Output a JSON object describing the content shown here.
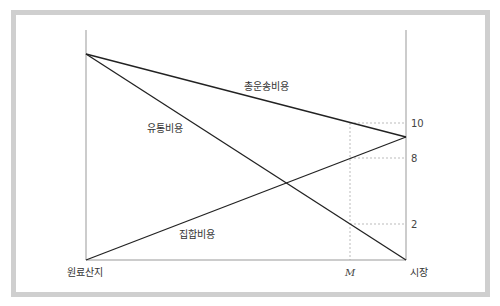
{
  "diagram": {
    "type": "transport-cost-diagram",
    "frame_color": "#cfcfcf",
    "line_color": "#222222",
    "axis_color": "#999999",
    "guide_color": "#aaaaaa",
    "labels": {
      "total_cost": "총운송비용",
      "distribution_cost": "유통비용",
      "collection_cost": "집합비용",
      "origin": "원료산지",
      "market": "시장",
      "optimal_point": "M"
    },
    "ticks": [
      {
        "value": "10",
        "y": 123
      },
      {
        "value": "8",
        "y": 158
      },
      {
        "value": "2",
        "y": 224
      }
    ],
    "geometry": {
      "left_axis_x": 86,
      "right_axis_x": 406,
      "axis_top_y": 30,
      "baseline_y": 260,
      "m_x": 350,
      "left_apex_y": 54,
      "right_apex_y": 137
    },
    "lines": [
      {
        "name": "total-cost-line",
        "from": [
          86,
          54
        ],
        "to": [
          406,
          137
        ]
      },
      {
        "name": "distribution-cost-line",
        "from": [
          86,
          54
        ],
        "to": [
          406,
          260
        ]
      },
      {
        "name": "collection-cost-line",
        "from": [
          86,
          260
        ],
        "to": [
          406,
          137
        ]
      }
    ]
  }
}
